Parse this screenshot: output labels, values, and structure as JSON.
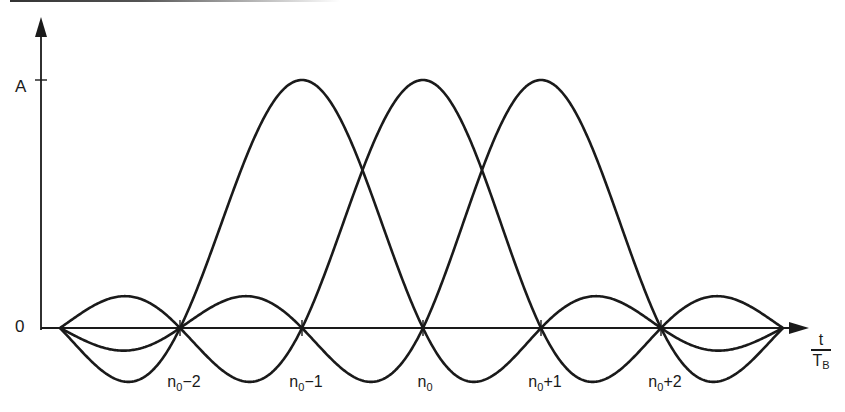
{
  "diagram": {
    "title": "",
    "y_axis": {
      "label_top": "A",
      "label_zero": "0"
    },
    "x_axis": {
      "label_numerator": "t",
      "label_denominator_main": "T",
      "label_denominator_sub": "B"
    },
    "tick_labels": [
      {
        "base": "n",
        "sub": "0",
        "suffix": "−2"
      },
      {
        "base": "n",
        "sub": "0",
        "suffix": "−1"
      },
      {
        "base": "n",
        "sub": "0",
        "suffix": ""
      },
      {
        "base": "n",
        "sub": "0",
        "suffix": "+1"
      },
      {
        "base": "n",
        "sub": "0",
        "suffix": "+2"
      }
    ],
    "stroke_color": "#1a1a1a",
    "background": "#ffffff"
  },
  "chart_data": {
    "type": "line",
    "title": "",
    "xlabel": "t / T_B",
    "ylabel": "",
    "x_ticks": [
      "n0-2",
      "n0-1",
      "n0",
      "n0+1",
      "n0+2"
    ],
    "y_ticks": [
      "0",
      "A"
    ],
    "xlim": [
      -3,
      3
    ],
    "ylim": [
      -0.25,
      1.0
    ],
    "series": [
      {
        "name": "pulse centered at n0-1",
        "center": -1,
        "amplitude": 1,
        "shape": "sinc"
      },
      {
        "name": "pulse centered at n0",
        "center": 0,
        "amplitude": 1,
        "shape": "sinc"
      },
      {
        "name": "pulse centered at n0+1",
        "center": 1,
        "amplitude": 1,
        "shape": "sinc"
      }
    ],
    "grid": false,
    "legend": false
  }
}
